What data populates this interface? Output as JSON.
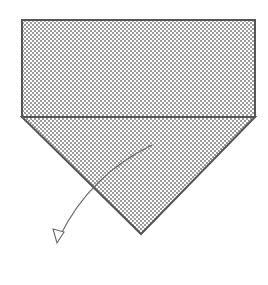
{
  "diagram": {
    "type": "origami-fold-step",
    "colors": {
      "background": "#ffffff",
      "outline": "#555555",
      "dot": "#6e6e6e",
      "arrow": "#666666"
    },
    "shapes": {
      "rectangle": {
        "x": 22,
        "y": 20,
        "width": 233,
        "height": 97
      },
      "triangle": {
        "points": "22,117 255,117 141,234"
      },
      "arrow": {
        "path": "M152,145 Q90,175 60,236",
        "head": "53,230 61,242 65,232"
      }
    },
    "labels": []
  }
}
